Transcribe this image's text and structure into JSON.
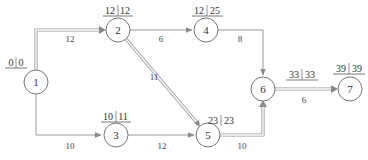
{
  "diagram": {
    "type": "network-critical-path",
    "nodes": [
      {
        "id": "1",
        "label": "1",
        "es": "0",
        "ls": "0"
      },
      {
        "id": "2",
        "label": "2",
        "es": "12",
        "ls": "12"
      },
      {
        "id": "3",
        "label": "3",
        "es": "10",
        "ls": "11"
      },
      {
        "id": "4",
        "label": "4",
        "es": "12",
        "ls": "25"
      },
      {
        "id": "5",
        "label": "5",
        "es": "23",
        "ls": "23"
      },
      {
        "id": "6",
        "label": "6",
        "es": "33",
        "ls": "33"
      },
      {
        "id": "7",
        "label": "7",
        "es": "39",
        "ls": "39"
      }
    ],
    "edges": [
      {
        "from": "1",
        "to": "2",
        "duration": "12",
        "critical": true
      },
      {
        "from": "1",
        "to": "3",
        "duration": "10",
        "critical": false
      },
      {
        "from": "2",
        "to": "4",
        "duration": "6",
        "critical": false
      },
      {
        "from": "2",
        "to": "5",
        "duration": "11",
        "critical": true
      },
      {
        "from": "3",
        "to": "5",
        "duration": "12",
        "critical": false
      },
      {
        "from": "4",
        "to": "6",
        "duration": "8",
        "critical": false
      },
      {
        "from": "5",
        "to": "6",
        "duration": "10",
        "critical": true
      },
      {
        "from": "6",
        "to": "7",
        "duration": "6",
        "critical": true
      }
    ],
    "colors": {
      "line": "#999999",
      "critical_line": "#9a9a9a",
      "node_stroke": "#777777",
      "text": "#333333"
    }
  }
}
